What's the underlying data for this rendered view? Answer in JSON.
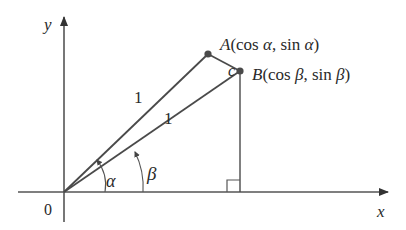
{
  "figure": {
    "axes": {
      "x_label": "x",
      "y_label": "y",
      "origin_label": "0"
    },
    "points": {
      "A": {
        "name": "A",
        "coords": "(cos α, sin α)",
        "coords_parts": [
          "(cos ",
          "α",
          ", sin ",
          "α",
          ")"
        ]
      },
      "B": {
        "name": "B",
        "coords": "(cos β, sin β)",
        "coords_parts": [
          "(cos ",
          "β",
          ", sin ",
          "β",
          ")"
        ]
      }
    },
    "segments": {
      "OA_label": "1",
      "OB_label": "1",
      "AB_label": "c"
    },
    "angles": {
      "alpha": "α",
      "beta": "β"
    },
    "colors": {
      "stroke": "#4a4a4a",
      "point": "#4a4a4a",
      "text": "#2a2a2a"
    }
  }
}
